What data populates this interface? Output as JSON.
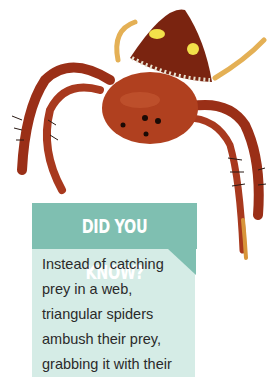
{
  "image": {
    "subject": "triangular spider",
    "icon": "spider-illustration",
    "colors": {
      "body": "#a8391e",
      "abdomen": "#7a2410",
      "spots": "#f2e14a",
      "legs_light": "#e8b45a"
    }
  },
  "callout": {
    "title": "DID YOU KNOW?",
    "lines": [
      "Instead of catching",
      "prey in a web,",
      "triangular spiders",
      "ambush their prey,",
      "grabbing it with their"
    ],
    "colors": {
      "banner": "#7fbfb1",
      "box": "#d5ece6",
      "title_text": "#ffffff",
      "body_text": "#2a2a2a"
    }
  }
}
